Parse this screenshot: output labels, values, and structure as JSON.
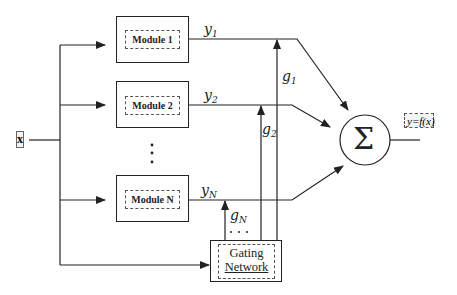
{
  "diagram": {
    "input": {
      "label": "x"
    },
    "modules": [
      {
        "label": "Module 1",
        "output": "y",
        "output_sub": "1",
        "gate": "g",
        "gate_sub": "1"
      },
      {
        "label": "Module 2",
        "output": "y",
        "output_sub": "2",
        "gate": "g",
        "gate_sub": "2"
      },
      {
        "label": "Module N",
        "output": "y",
        "output_sub": "N",
        "gate": "g",
        "gate_sub": "N"
      }
    ],
    "ellipsis_vertical": "⋮",
    "ellipsis_horizontal": "…",
    "gating_network": {
      "line1": "Gating",
      "line2": "Network"
    },
    "summation": {
      "symbol": "Σ"
    },
    "output": {
      "label": "y=f(x)"
    }
  }
}
